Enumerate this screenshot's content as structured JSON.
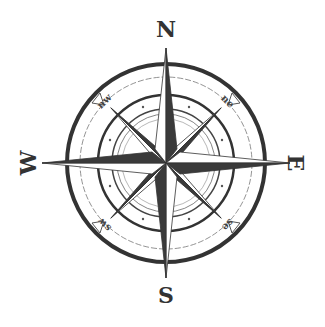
{
  "center": {
    "x": 166,
    "y": 163
  },
  "colors": {
    "ink": "#333333",
    "fill_light": "#ffffff",
    "fill_dark": "#3a3a3a",
    "background": "#ffffff"
  },
  "cardinal_labels": {
    "north": "N",
    "east": "E",
    "south": "S",
    "west": "W"
  },
  "intercardinal_labels": {
    "northeast": "ne",
    "southeast": "se",
    "southwest": "sw",
    "northwest": "nw"
  }
}
